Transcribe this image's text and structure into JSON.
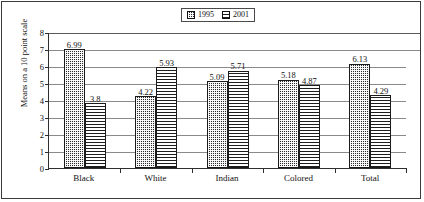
{
  "chart_data": {
    "type": "bar",
    "title": "",
    "xlabel": "",
    "ylabel": "Means on a 10 point scale",
    "ylim": [
      0,
      8
    ],
    "yticks": [
      "0",
      "1",
      "2",
      "3",
      "4",
      "5",
      "6",
      "7",
      "8"
    ],
    "grid": true,
    "legend_position": "top-center",
    "categories": [
      "Black",
      "White",
      "Indian",
      "Colored",
      "Total"
    ],
    "series": [
      {
        "name": "1995",
        "pattern": "dotted-checker",
        "values": [
          6.99,
          4.22,
          5.09,
          5.18,
          6.13
        ],
        "labels": [
          "6.99",
          "4.22",
          "5.09",
          "5.18",
          "6.13"
        ]
      },
      {
        "name": "2001",
        "pattern": "horizontal-lines",
        "values": [
          3.8,
          5.93,
          5.71,
          4.87,
          4.29
        ],
        "labels": [
          "3.8",
          "5.93",
          "5.71",
          "4.87",
          "4.29"
        ]
      }
    ]
  },
  "legend": {
    "entries": [
      {
        "label": "1995"
      },
      {
        "label": "2001"
      }
    ]
  },
  "colors": {
    "series_1995": "#2b2b2b",
    "series_2001": "#1d1d1d",
    "axis": "#2e2e2e",
    "gridline": "#8a8a8a",
    "frame": "#3a3a3a",
    "background": "#ffffff",
    "text": "#111111"
  }
}
